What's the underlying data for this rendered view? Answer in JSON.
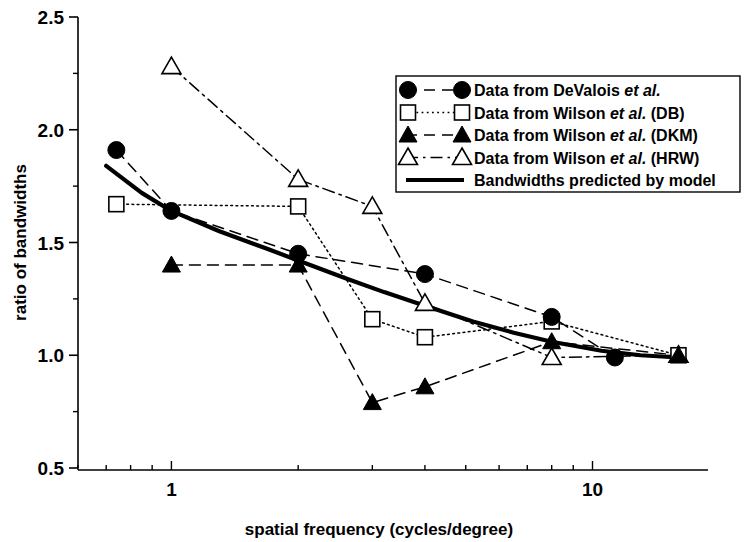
{
  "chart_data": {
    "type": "line",
    "title": "",
    "xlabel": "spatial frequency (cycles/degree)",
    "ylabel": "ratio of bandwidths",
    "xscale": "log",
    "yscale": "linear",
    "xlim": [
      0.6,
      18
    ],
    "ylim": [
      0.5,
      2.5
    ],
    "xtick_labels": [
      "1",
      "10"
    ],
    "xticks": [
      1,
      10
    ],
    "ytick_labels": [
      "0.5",
      "1.0",
      "1.5",
      "2.0",
      "2.5"
    ],
    "yticks": [
      0.5,
      1.0,
      1.5,
      2.0,
      2.5
    ],
    "y_minor_ticks": [
      0.75,
      1.25,
      1.75,
      2.25
    ],
    "grid": false,
    "legend_position": "top-right",
    "series": [
      {
        "name": "Data from DeValois et al.",
        "marker": "filled-circle",
        "linestyle": "dashed",
        "color": "#000000",
        "points": [
          {
            "x": 0.74,
            "y": 1.91
          },
          {
            "x": 1.0,
            "y": 1.64
          },
          {
            "x": 2.0,
            "y": 1.45
          },
          {
            "x": 4.0,
            "y": 1.36
          },
          {
            "x": 8.0,
            "y": 1.17
          },
          {
            "x": 11.3,
            "y": 0.99
          }
        ]
      },
      {
        "name": "Data from Wilson et al. (DB)",
        "marker": "open-square",
        "linestyle": "dotted",
        "color": "#000000",
        "points": [
          {
            "x": 0.74,
            "y": 1.67
          },
          {
            "x": 2.0,
            "y": 1.66
          },
          {
            "x": 3.0,
            "y": 1.16
          },
          {
            "x": 4.0,
            "y": 1.08
          },
          {
            "x": 8.0,
            "y": 1.15
          },
          {
            "x": 16.0,
            "y": 1.0
          }
        ]
      },
      {
        "name": "Data from Wilson et al. (DKM)",
        "marker": "filled-triangle",
        "linestyle": "dashed",
        "color": "#000000",
        "points": [
          {
            "x": 1.0,
            "y": 1.4
          },
          {
            "x": 2.0,
            "y": 1.4
          },
          {
            "x": 3.0,
            "y": 0.79
          },
          {
            "x": 4.0,
            "y": 0.86
          },
          {
            "x": 8.0,
            "y": 1.06
          },
          {
            "x": 16.0,
            "y": 1.0
          }
        ]
      },
      {
        "name": "Data from Wilson et al. (HRW)",
        "marker": "open-triangle",
        "linestyle": "dashdot",
        "color": "#000000",
        "points": [
          {
            "x": 1.0,
            "y": 2.28
          },
          {
            "x": 2.0,
            "y": 1.78
          },
          {
            "x": 3.0,
            "y": 1.66
          },
          {
            "x": 4.0,
            "y": 1.23
          },
          {
            "x": 8.0,
            "y": 0.99
          },
          {
            "x": 16.0,
            "y": 1.0
          }
        ]
      },
      {
        "name": "Bandwidths predicted by model",
        "marker": "none",
        "linestyle": "solid-thick",
        "color": "#000000",
        "points": [
          {
            "x": 0.7,
            "y": 1.84
          },
          {
            "x": 0.85,
            "y": 1.72
          },
          {
            "x": 1.0,
            "y": 1.64
          },
          {
            "x": 1.3,
            "y": 1.55
          },
          {
            "x": 1.7,
            "y": 1.47
          },
          {
            "x": 2.0,
            "y": 1.42
          },
          {
            "x": 2.6,
            "y": 1.34
          },
          {
            "x": 3.2,
            "y": 1.28
          },
          {
            "x": 4.0,
            "y": 1.22
          },
          {
            "x": 5.2,
            "y": 1.15
          },
          {
            "x": 6.5,
            "y": 1.1
          },
          {
            "x": 8.0,
            "y": 1.06
          },
          {
            "x": 10.5,
            "y": 1.02
          },
          {
            "x": 13.0,
            "y": 1.0
          },
          {
            "x": 16.0,
            "y": 0.99
          }
        ]
      }
    ]
  },
  "legend": {
    "entries": [
      {
        "label_plain": "Data from DeValois ",
        "label_em": "et al.",
        "label_tail": "",
        "marker": "filled-circle",
        "linestyle": "dashed"
      },
      {
        "label_plain": "Data from Wilson ",
        "label_em": "et al.",
        "label_tail": " (DB)",
        "marker": "open-square",
        "linestyle": "dotted"
      },
      {
        "label_plain": "Data from Wilson ",
        "label_em": "et al.",
        "label_tail": " (DKM)",
        "marker": "filled-triangle",
        "linestyle": "dashed"
      },
      {
        "label_plain": "Data from Wilson ",
        "label_em": "et al.",
        "label_tail": " (HRW)",
        "marker": "open-triangle",
        "linestyle": "dashdot"
      },
      {
        "label_plain": "Bandwidths predicted by model",
        "label_em": "",
        "label_tail": "",
        "marker": "none",
        "linestyle": "solid-thick"
      }
    ]
  },
  "axes": {
    "y_title": "ratio of bandwidths",
    "x_title": "spatial frequency (cycles/degree)",
    "y_labels": [
      "2.5",
      "2.0",
      "1.5",
      "1.0",
      "0.5"
    ],
    "x_labels": [
      "1",
      "10"
    ]
  },
  "colors": {
    "ink": "#000000",
    "background": "#ffffff"
  }
}
